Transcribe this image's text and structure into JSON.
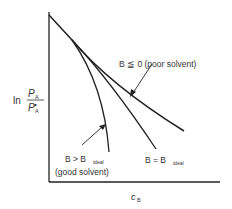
{
  "diagram": {
    "y_axis_label": {
      "prefix": "ln",
      "numerator": "P",
      "numerator_sub": "A",
      "denominator": "P",
      "denominator_sub": "A",
      "denominator_sup": "•"
    },
    "x_axis_label": {
      "main": "c",
      "sub": "B"
    },
    "curves": [
      {
        "id": "poor-solvent",
        "label": "B ≦ 0 (poor solvent)"
      },
      {
        "id": "ideal",
        "label_main": "B = B",
        "label_sub": "ideal"
      },
      {
        "id": "good-solvent",
        "label_main": "B > B",
        "label_sub": "ideal",
        "label_line2": "(good solvent)"
      }
    ]
  }
}
